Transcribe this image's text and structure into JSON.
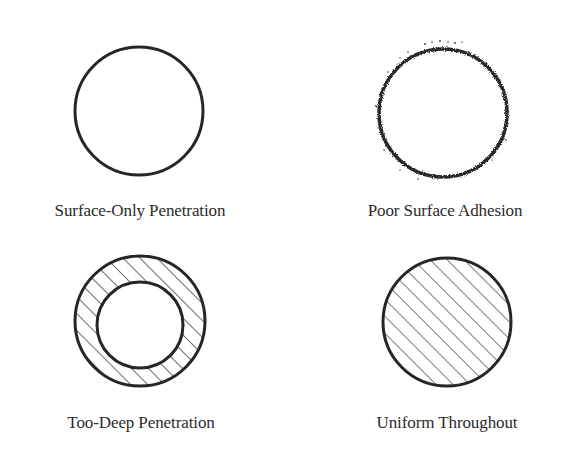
{
  "diagram": {
    "type": "cross-section comparison",
    "line_color": "#262626",
    "panels": [
      {
        "id": "surface-only",
        "label": "Surface-Only Penetration",
        "shape": "circle outline",
        "fill": "none"
      },
      {
        "id": "poor-adhesion",
        "label": "Poor Surface Adhesion",
        "shape": "circle outline with speckled/rough edge",
        "fill": "none"
      },
      {
        "id": "too-deep",
        "label": "Too-Deep Penetration",
        "shape": "ring (outer circle with inner circle)",
        "fill": "diagonal hatching in ring only"
      },
      {
        "id": "uniform",
        "label": "Uniform Throughout",
        "shape": "circle",
        "fill": "diagonal hatching throughout"
      }
    ]
  }
}
